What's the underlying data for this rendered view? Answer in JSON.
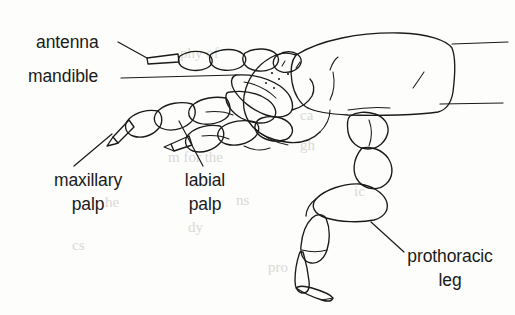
{
  "figure": {
    "type": "scientific-line-drawing",
    "style": "black ink line art on white paper",
    "background_note": "faint show-through text from the reverse side of the scanned page"
  },
  "labels": [
    {
      "id": "antenna",
      "text": "antenna",
      "text_x": 36,
      "text_y": 48,
      "anchor": "start",
      "leader": "M118,42 L147,58",
      "leader_target": "antennal segments at upper left of head"
    },
    {
      "id": "mandible",
      "text": "mandible",
      "text_x": 28,
      "text_y": 82,
      "anchor": "start",
      "leader": "M121,78 L236,75",
      "leader_target": "mandible below the antenna base"
    },
    {
      "id": "maxillary-palp",
      "text_line_1": "maxillary",
      "text_line_2": "palp",
      "text_x": 88,
      "text_y": 186,
      "anchor": "middle",
      "line_height": 24,
      "leader": "M112,134 L74,166",
      "leader_target": "terminal segment of the maxillary palp"
    },
    {
      "id": "labial-palp",
      "text_line_1": "labial",
      "text_line_2": "palp",
      "text_x": 205,
      "text_y": 186,
      "anchor": "middle",
      "line_height": 24,
      "leader": "M179,121 L203,166",
      "leader_target": "labial palp segment"
    },
    {
      "id": "prothoracic-leg",
      "text_line_1": "prothoracic",
      "text_line_2": "leg",
      "text_x": 450,
      "text_y": 262,
      "anchor": "middle",
      "line_height": 24,
      "leader": "M371,222 L404,252",
      "leader_target": "trochanter / femur joint of the foreleg"
    }
  ],
  "unlabeled_leaders": [
    {
      "id": "upper-right-stub",
      "path": "M452,44 L508,42"
    },
    {
      "id": "lower-right-stub",
      "path": "M440,104 L503,103"
    }
  ],
  "ghost_text": [
    {
      "text": "phy of",
      "x": 180,
      "y": 58
    },
    {
      "text": "ca",
      "x": 300,
      "y": 120
    },
    {
      "text": "m for the",
      "x": 168,
      "y": 162
    },
    {
      "text": "gh",
      "x": 300,
      "y": 150
    },
    {
      "text": "ic",
      "x": 354,
      "y": 196
    },
    {
      "text": "ns",
      "x": 236,
      "y": 205
    },
    {
      "text": "he",
      "x": 105,
      "y": 207
    },
    {
      "text": "dy",
      "x": 188,
      "y": 232
    },
    {
      "text": "cs",
      "x": 72,
      "y": 250
    },
    {
      "text": "pro",
      "x": 268,
      "y": 272
    }
  ],
  "colors": {
    "ink": "#1a1a1a",
    "paper": "#fdfdfb",
    "ghost": "#cfcdc8"
  }
}
